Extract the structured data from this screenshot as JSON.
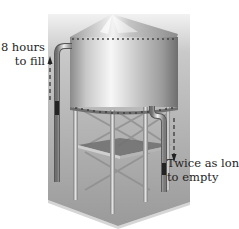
{
  "figure": {
    "fill_label": {
      "line1": "8 hours",
      "line2": "to fill"
    },
    "empty_label": {
      "line1": "Twice as long",
      "line2": "to empty"
    },
    "colors": {
      "background_box": "#a9a9a9",
      "box_top": "#d9d9d9",
      "tank_light": "#f4f4f4",
      "tank_dark": "#8c8c8c",
      "pipe": "#bdbdbd",
      "text": "#1e1e1e"
    }
  }
}
